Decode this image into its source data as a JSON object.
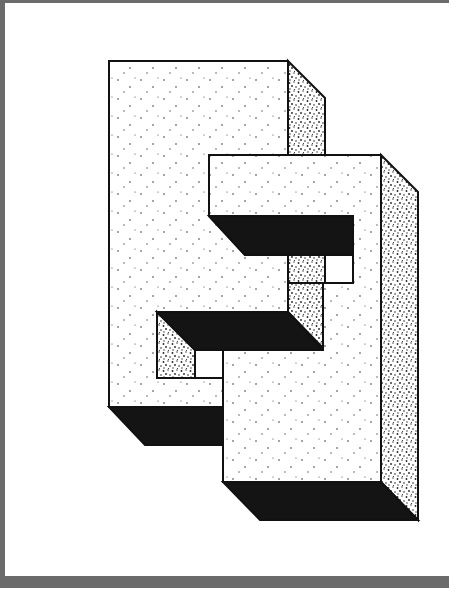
{
  "artwork": {
    "title": "Interlocking impossible blocks",
    "description": "Two stippled 3D block shapes interlocking in an impossible arrangement, with solid black shadow faces",
    "colors": {
      "frame": "#6b6b6b",
      "background": "#ffffff",
      "line": "#111111",
      "shadow": "#141414",
      "light_face": "#ffffff",
      "dense_face": "#ffffff"
    }
  }
}
